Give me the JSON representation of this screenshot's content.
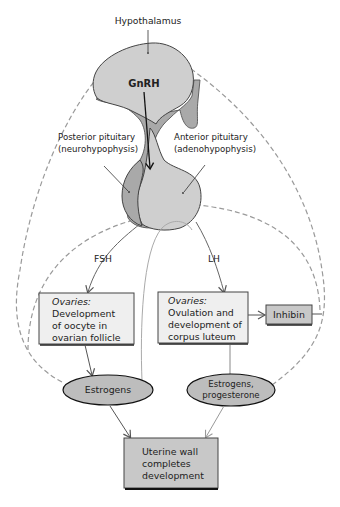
{
  "diagram": {
    "labels": {
      "hypothalamus": "Hypothalamus",
      "gnrh": "GnRH",
      "posterior_line1": "Posterior pituitary",
      "posterior_line2": "(neurohypophysis)",
      "anterior_line1": "Anterior pituitary",
      "anterior_line2": "(adenohypophysis)",
      "fsh": "FSH",
      "lh": "LH"
    },
    "boxes": {
      "ovaries_left": {
        "heading": "Ovaries:",
        "lines": [
          "Development",
          "of oocyte in",
          "ovarian follicle"
        ]
      },
      "ovaries_right": {
        "heading": "Ovaries:",
        "lines": [
          "Ovulation and",
          "development of",
          "corpus luteum"
        ]
      },
      "inhibin": {
        "label": "Inhibin"
      },
      "uterine": {
        "lines": [
          "Uterine wall",
          "completes",
          "development"
        ]
      }
    },
    "ellipses": {
      "estrogens": {
        "label": "Estrogens"
      },
      "estrogens_progesterone": {
        "line1": "Estrogens,",
        "line2": "progesterone"
      }
    },
    "colors": {
      "gland_fill": "#cfcfcf",
      "posterior_fill": "#a9a9a9",
      "box_fill": "#efefef",
      "dark_box_fill": "#c8c8c8",
      "ellipse_fill": "#bdbdbd",
      "dashed_stroke": "#9a9a9a",
      "solid_arrow": "#666666"
    }
  }
}
